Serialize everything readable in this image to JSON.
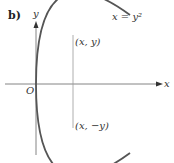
{
  "figure": {
    "part_label": "b)",
    "axes": {
      "x_label": "x",
      "y_label": "y",
      "origin_label": "O"
    },
    "curve": {
      "equation_label": "x = y²",
      "type": "parabola",
      "opens": "right"
    },
    "points": {
      "upper": "(x, y)",
      "lower": "(x, −y)"
    },
    "colors": {
      "curve": "#555555",
      "axis": "#777777",
      "guide_line": "#999999",
      "text": "#333333"
    }
  }
}
